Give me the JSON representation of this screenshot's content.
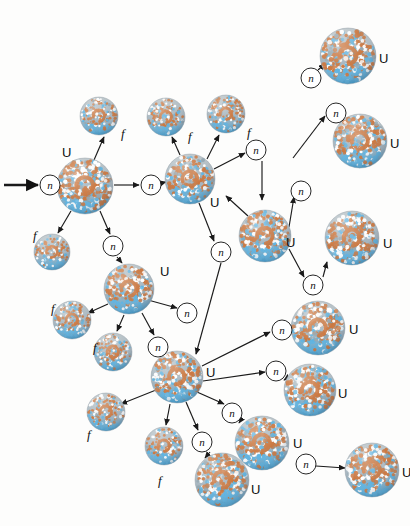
{
  "figure": {
    "labels": {
      "uranium": "U",
      "fragment": "f",
      "neutron": "n"
    },
    "colors": {
      "background": "#fdfdfc",
      "proton": "#c87137",
      "neutron_dot": "#57b0e0",
      "highlight": "#ffffff",
      "rim": "#8f9aa3",
      "arrow": "#1a1a1a",
      "text": "#111111"
    },
    "counts": {
      "uranium_nuclei": 14,
      "fission_fragments": 8,
      "neutron_circles": 17
    }
  },
  "incoming_arrow": {
    "x1": 4,
    "y1": 185,
    "x2": 38,
    "y2": 185
  },
  "nuclei": [
    {
      "id": "u0",
      "type": "uranium",
      "cx": 85,
      "cy": 186,
      "r": 28,
      "label": "U",
      "lx": 62,
      "ly": 146
    },
    {
      "id": "f0",
      "type": "fragment",
      "cx": 99,
      "cy": 116,
      "r": 19,
      "label": "f",
      "lx": 121,
      "ly": 127
    },
    {
      "id": "f1",
      "type": "fragment",
      "cx": 52,
      "cy": 252,
      "r": 18,
      "label": "f",
      "lx": 33,
      "ly": 229
    },
    {
      "id": "u1",
      "type": "uranium",
      "cx": 190,
      "cy": 179,
      "r": 25,
      "label": "U",
      "lx": 210,
      "ly": 196
    },
    {
      "id": "f2",
      "type": "fragment",
      "cx": 166,
      "cy": 117,
      "r": 19,
      "label": "f",
      "lx": 188,
      "ly": 130
    },
    {
      "id": "f3",
      "type": "fragment",
      "cx": 226,
      "cy": 114,
      "r": 19,
      "label": "f",
      "lx": 247,
      "ly": 126
    },
    {
      "id": "u2",
      "type": "uranium",
      "cx": 348,
      "cy": 56,
      "r": 28,
      "label": "U",
      "lx": 379,
      "ly": 52
    },
    {
      "id": "u3",
      "type": "uranium",
      "cx": 360,
      "cy": 141,
      "r": 27,
      "label": "U",
      "lx": 390,
      "ly": 137
    },
    {
      "id": "u4",
      "type": "uranium",
      "cx": 265,
      "cy": 236,
      "r": 26,
      "label": "U",
      "lx": 286,
      "ly": 236
    },
    {
      "id": "u5",
      "type": "uranium",
      "cx": 318,
      "cy": 328,
      "r": 27,
      "label": "U",
      "lx": 349,
      "ly": 323
    },
    {
      "id": "u6",
      "type": "uranium",
      "cx": 310,
      "cy": 390,
      "r": 26,
      "label": "U",
      "lx": 338,
      "ly": 387
    },
    {
      "id": "u7",
      "type": "uranium",
      "cx": 129,
      "cy": 289,
      "r": 25,
      "label": "U",
      "lx": 160,
      "ly": 265
    },
    {
      "id": "f4",
      "type": "fragment",
      "cx": 72,
      "cy": 320,
      "r": 19,
      "label": "f",
      "lx": 51,
      "ly": 302
    },
    {
      "id": "f5",
      "type": "fragment",
      "cx": 113,
      "cy": 352,
      "r": 19,
      "label": "f",
      "lx": 93,
      "ly": 341
    },
    {
      "id": "u8",
      "type": "uranium",
      "cx": 177,
      "cy": 377,
      "r": 26,
      "label": "U",
      "lx": 206,
      "ly": 366
    },
    {
      "id": "f6",
      "type": "fragment",
      "cx": 106,
      "cy": 412,
      "r": 19,
      "label": "f",
      "lx": 87,
      "ly": 428
    },
    {
      "id": "f7",
      "type": "fragment",
      "cx": 164,
      "cy": 446,
      "r": 19,
      "label": "f",
      "lx": 158,
      "ly": 474
    },
    {
      "id": "u9",
      "type": "uranium",
      "cx": 262,
      "cy": 443,
      "r": 27,
      "label": "U",
      "lx": 293,
      "ly": 437
    },
    {
      "id": "u10",
      "type": "uranium",
      "cx": 222,
      "cy": 480,
      "r": 27,
      "label": "U",
      "lx": 251,
      "ly": 483
    },
    {
      "id": "u11",
      "type": "uranium",
      "cx": 352,
      "cy": 238,
      "r": 27,
      "label": "U",
      "lx": 383,
      "ly": 237
    },
    {
      "id": "u12",
      "type": "uranium",
      "cx": 372,
      "cy": 470,
      "r": 27,
      "label": "U",
      "lx": 402,
      "ly": 466
    }
  ],
  "neutrons": [
    {
      "id": "n0",
      "cx": 50,
      "cy": 185,
      "r": 10,
      "label": "n"
    },
    {
      "id": "n1",
      "cx": 151,
      "cy": 185,
      "r": 10,
      "label": "n"
    },
    {
      "id": "n2",
      "cx": 113,
      "cy": 246,
      "r": 10,
      "label": "n"
    },
    {
      "id": "n3",
      "cx": 256,
      "cy": 150,
      "r": 10,
      "label": "n"
    },
    {
      "id": "n4",
      "cx": 311,
      "cy": 78,
      "r": 10,
      "label": "n"
    },
    {
      "id": "n5",
      "cx": 336,
      "cy": 113,
      "r": 10,
      "label": "n"
    },
    {
      "id": "n6",
      "cx": 221,
      "cy": 252,
      "r": 10,
      "label": "n"
    },
    {
      "id": "n7",
      "cx": 301,
      "cy": 191,
      "r": 10,
      "label": "n"
    },
    {
      "id": "n8",
      "cx": 313,
      "cy": 285,
      "r": 10,
      "label": "n"
    },
    {
      "id": "n9",
      "cx": 187,
      "cy": 313,
      "r": 10,
      "label": "n"
    },
    {
      "id": "n10",
      "cx": 158,
      "cy": 347,
      "r": 10,
      "label": "n"
    },
    {
      "id": "n11",
      "cx": 282,
      "cy": 330,
      "r": 10,
      "label": "n"
    },
    {
      "id": "n12",
      "cx": 276,
      "cy": 371,
      "r": 10,
      "label": "n"
    },
    {
      "id": "n13",
      "cx": 232,
      "cy": 413,
      "r": 10,
      "label": "n"
    },
    {
      "id": "n14",
      "cx": 202,
      "cy": 442,
      "r": 10,
      "label": "n"
    },
    {
      "id": "n15",
      "cx": 306,
      "cy": 464,
      "r": 10,
      "label": "n"
    }
  ],
  "arrows": [
    {
      "from": "n0",
      "to": "u0",
      "x1": 61,
      "y1": 185,
      "x2": 57,
      "y2": 185
    },
    {
      "from": "u0",
      "to": "f0",
      "x1": 94,
      "y1": 160,
      "x2": 104,
      "y2": 137
    },
    {
      "from": "u0",
      "to": "f1",
      "x1": 71,
      "y1": 211,
      "x2": 58,
      "y2": 233
    },
    {
      "from": "u0",
      "to": "n1",
      "x1": 114,
      "y1": 185,
      "x2": 139,
      "y2": 185
    },
    {
      "from": "u0",
      "to": "n2",
      "x1": 100,
      "y1": 211,
      "x2": 110,
      "y2": 234
    },
    {
      "from": "n1",
      "to": "u1",
      "x1": 162,
      "y1": 183,
      "x2": 166,
      "y2": 182
    },
    {
      "from": "u1",
      "to": "f2",
      "x1": 180,
      "y1": 155,
      "x2": 172,
      "y2": 137
    },
    {
      "from": "u1",
      "to": "f3",
      "x1": 207,
      "y1": 159,
      "x2": 219,
      "y2": 135
    },
    {
      "from": "u1",
      "to": "n3",
      "x1": 214,
      "y1": 169,
      "x2": 245,
      "y2": 153
    },
    {
      "from": "u1",
      "to": "n6",
      "x1": 199,
      "y1": 203,
      "x2": 214,
      "y2": 241
    },
    {
      "from": "n3",
      "to": "u4",
      "x1": 262,
      "y1": 161,
      "x2": 262,
      "y2": 200
    },
    {
      "from": "u4",
      "to": "n4",
      "x1": 248,
      "y1": 216,
      "x2": 226,
      "y2": 196
    },
    {
      "from": "u4",
      "to": "n7",
      "x1": 289,
      "y1": 227,
      "x2": 294,
      "y2": 197
    },
    {
      "from": "u4",
      "to": "n8",
      "x1": 289,
      "y1": 249,
      "x2": 304,
      "y2": 277
    },
    {
      "from": "n4",
      "to": "u2",
      "x1": 318,
      "y1": 70,
      "x2": 325,
      "y2": 64
    },
    {
      "from": "n5",
      "to": "u3",
      "x1": 343,
      "y1": 122,
      "x2": 340,
      "y2": 124
    },
    {
      "from": "x1",
      "to": "n5",
      "x1": 293,
      "y1": 158,
      "x2": 325,
      "y2": 116
    },
    {
      "from": "u7",
      "to": "n9",
      "x1": 148,
      "y1": 300,
      "x2": 177,
      "y2": 308
    },
    {
      "from": "u7",
      "to": "f4",
      "x1": 108,
      "y1": 304,
      "x2": 88,
      "y2": 313
    },
    {
      "from": "u7",
      "to": "f5",
      "x1": 124,
      "y1": 315,
      "x2": 117,
      "y2": 331
    },
    {
      "from": "u7",
      "to": "n10",
      "x1": 142,
      "y1": 313,
      "x2": 154,
      "y2": 335
    },
    {
      "from": "n2",
      "to": "u7",
      "x1": 117,
      "y1": 257,
      "x2": 122,
      "y2": 263
    },
    {
      "from": "n6",
      "to": "u8",
      "x1": 221,
      "y1": 263,
      "x2": 196,
      "y2": 354
    },
    {
      "from": "u8",
      "to": "n11",
      "x1": 202,
      "y1": 366,
      "x2": 270,
      "y2": 332
    },
    {
      "from": "u8",
      "to": "n12",
      "x1": 203,
      "y1": 381,
      "x2": 265,
      "y2": 372
    },
    {
      "from": "u8",
      "to": "f6",
      "x1": 156,
      "y1": 390,
      "x2": 121,
      "y2": 404
    },
    {
      "from": "u8",
      "to": "f7",
      "x1": 170,
      "y1": 404,
      "x2": 166,
      "y2": 425
    },
    {
      "from": "u8",
      "to": "n13",
      "x1": 197,
      "y1": 392,
      "x2": 224,
      "y2": 404
    },
    {
      "from": "u8",
      "to": "n14",
      "x1": 186,
      "y1": 402,
      "x2": 198,
      "y2": 430
    },
    {
      "from": "n11",
      "to": "u5",
      "x1": 293,
      "y1": 330,
      "x2": 290,
      "y2": 330
    },
    {
      "from": "n12",
      "to": "u6",
      "x1": 287,
      "y1": 378,
      "x2": 284,
      "y2": 380
    },
    {
      "from": "n8",
      "to": "u11",
      "x1": 323,
      "y1": 277,
      "x2": 327,
      "y2": 262
    },
    {
      "from": "n13",
      "to": "u9",
      "x1": 241,
      "y1": 420,
      "x2": 239,
      "y2": 423
    },
    {
      "from": "n14",
      "to": "u10",
      "x1": 210,
      "y1": 452,
      "x2": 205,
      "y2": 458
    },
    {
      "from": "n15",
      "to": "u12",
      "x1": 316,
      "y1": 466,
      "x2": 345,
      "y2": 468
    }
  ]
}
